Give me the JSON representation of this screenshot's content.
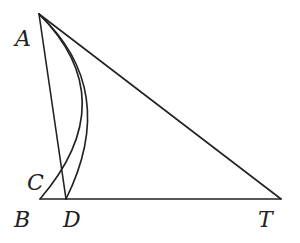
{
  "diagram": {
    "type": "geometry",
    "points": [
      {
        "name": "A",
        "x": 39,
        "y": 14,
        "label_x": 15,
        "label_y": 46
      },
      {
        "name": "B",
        "x": 40,
        "y": 199,
        "label_x": 14,
        "label_y": 227
      },
      {
        "name": "C",
        "x": 55,
        "y": 180,
        "label_x": 27,
        "label_y": 190
      },
      {
        "name": "D",
        "x": 66,
        "y": 199,
        "label_x": 63,
        "label_y": 227
      },
      {
        "name": "T",
        "x": 281,
        "y": 199,
        "label_x": 258,
        "label_y": 227
      }
    ],
    "segments": [
      {
        "from": "A",
        "to": "D"
      },
      {
        "from": "A",
        "to": "T"
      },
      {
        "from": "B",
        "to": "T"
      }
    ],
    "arcs": [
      {
        "from": "A",
        "to": "D",
        "through_right": true
      },
      {
        "from": "A",
        "to": "B",
        "via": "C"
      }
    ]
  },
  "labels": {
    "A": "A",
    "B": "B",
    "C": "C",
    "D": "D",
    "T": "T"
  }
}
